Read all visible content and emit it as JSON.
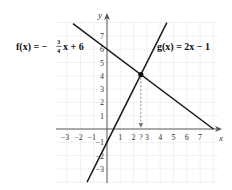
{
  "chart_data": {
    "type": "line",
    "title": "",
    "xlabel": "x",
    "ylabel": "y",
    "xlim": [
      -3.8,
      8.3
    ],
    "ylim": [
      -4,
      8
    ],
    "grid": true,
    "x_ticks": [
      "-3",
      "-2",
      "-1",
      "1",
      "2",
      "?",
      "3",
      "4",
      "5",
      "6",
      "7"
    ],
    "y_ticks": [
      "7",
      "6",
      "5",
      "4",
      "3",
      "2",
      "1",
      "-1",
      "-2",
      "-3"
    ],
    "series": [
      {
        "name": "f(x) = -3/4 x + 6",
        "slope": -0.75,
        "intercept": 6,
        "x": [
          -2.56,
          8
        ],
        "y": [
          7.92,
          0
        ]
      },
      {
        "name": "g(x) = 2x - 1",
        "slope": 2,
        "intercept": -1,
        "x": [
          -1.5,
          4.5
        ],
        "y": [
          -4,
          8
        ]
      }
    ],
    "annotations": [
      {
        "type": "point",
        "label": "intersection",
        "x": 2.545,
        "y": 4.09
      },
      {
        "type": "dashed-arrow",
        "from": [
          2.545,
          4.09
        ],
        "to": [
          2.545,
          0
        ],
        "label": "?"
      }
    ]
  },
  "labels": {
    "f_eq": {
      "prefix": "f(x) = −",
      "num": "3",
      "den": "4",
      "suffix": "x + 6"
    },
    "g_eq": "g(x) = 2x − 1",
    "x_axis": "x",
    "y_axis": "y",
    "question": "?"
  }
}
